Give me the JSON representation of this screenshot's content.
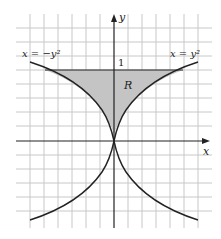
{
  "figure": {
    "type": "region-between-curves",
    "axes": {
      "x_label": "x",
      "y_label": "y"
    },
    "tick_label_y": "1",
    "curve_left_label": "x = −y²",
    "curve_right_label": "x = y²",
    "region_label": "R",
    "colors": {
      "grid": "#c8c8c8",
      "axis": "#222222",
      "curve": "#222222",
      "region_fill": "#c4c4c4"
    }
  }
}
